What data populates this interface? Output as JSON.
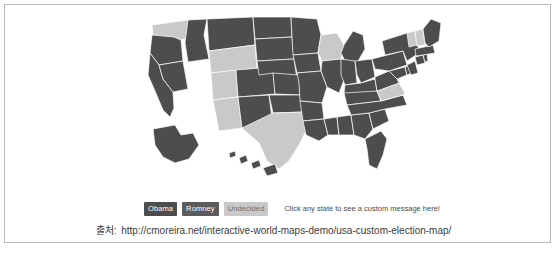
{
  "card": {
    "border_color": "#b9b9b9",
    "background": "#ffffff"
  },
  "legend": {
    "items": [
      {
        "label": "Obama",
        "color": "#4d4d4d",
        "text_color": "#ffffff"
      },
      {
        "label": "Romney",
        "color": "#5c5c5c",
        "text_color": "#ffffff"
      },
      {
        "label": "Undecided",
        "color": "#c9c9c9",
        "text_color": "#6e6e6e"
      }
    ],
    "hint": "Click any state to see a custom message here!"
  },
  "caption": {
    "source_label": "출처:",
    "url": "http://cmoreira.net/interactive-world-maps-demo/usa-custom-election-map/"
  },
  "map": {
    "title": "USA Custom Election Map",
    "colors": {
      "obama": "#4d4d4d",
      "romney": "#5c5c5c",
      "undecided": "#c9c9c9",
      "border": "#ffffff",
      "background": "#ffffff"
    },
    "legend_position": "below-map-left",
    "states": [
      {
        "code": "WA",
        "name": "Washington",
        "status": "Undecided"
      },
      {
        "code": "OR",
        "name": "Oregon",
        "status": "Obama"
      },
      {
        "code": "CA",
        "name": "California",
        "status": "Obama"
      },
      {
        "code": "NV",
        "name": "Nevada",
        "status": "Obama"
      },
      {
        "code": "ID",
        "name": "Idaho",
        "status": "Obama"
      },
      {
        "code": "MT",
        "name": "Montana",
        "status": "Obama"
      },
      {
        "code": "WY",
        "name": "Wyoming",
        "status": "Undecided"
      },
      {
        "code": "UT",
        "name": "Utah",
        "status": "Undecided"
      },
      {
        "code": "AZ",
        "name": "Arizona",
        "status": "Undecided"
      },
      {
        "code": "CO",
        "name": "Colorado",
        "status": "Obama"
      },
      {
        "code": "NM",
        "name": "New Mexico",
        "status": "Obama"
      },
      {
        "code": "ND",
        "name": "North Dakota",
        "status": "Obama"
      },
      {
        "code": "SD",
        "name": "South Dakota",
        "status": "Obama"
      },
      {
        "code": "NE",
        "name": "Nebraska",
        "status": "Obama"
      },
      {
        "code": "KS",
        "name": "Kansas",
        "status": "Obama"
      },
      {
        "code": "OK",
        "name": "Oklahoma",
        "status": "Obama"
      },
      {
        "code": "TX",
        "name": "Texas",
        "status": "Undecided"
      },
      {
        "code": "MN",
        "name": "Minnesota",
        "status": "Obama"
      },
      {
        "code": "IA",
        "name": "Iowa",
        "status": "Obama"
      },
      {
        "code": "MO",
        "name": "Missouri",
        "status": "Obama"
      },
      {
        "code": "AR",
        "name": "Arkansas",
        "status": "Obama"
      },
      {
        "code": "LA",
        "name": "Louisiana",
        "status": "Obama"
      },
      {
        "code": "WI",
        "name": "Wisconsin",
        "status": "Undecided"
      },
      {
        "code": "IL",
        "name": "Illinois",
        "status": "Obama"
      },
      {
        "code": "MI",
        "name": "Michigan",
        "status": "Obama"
      },
      {
        "code": "IN",
        "name": "Indiana",
        "status": "Obama"
      },
      {
        "code": "OH",
        "name": "Ohio",
        "status": "Obama"
      },
      {
        "code": "KY",
        "name": "Kentucky",
        "status": "Obama"
      },
      {
        "code": "TN",
        "name": "Tennessee",
        "status": "Obama"
      },
      {
        "code": "MS",
        "name": "Mississippi",
        "status": "Obama"
      },
      {
        "code": "AL",
        "name": "Alabama",
        "status": "Obama"
      },
      {
        "code": "GA",
        "name": "Georgia",
        "status": "Obama"
      },
      {
        "code": "FL",
        "name": "Florida",
        "status": "Obama"
      },
      {
        "code": "SC",
        "name": "South Carolina",
        "status": "Obama"
      },
      {
        "code": "NC",
        "name": "North Carolina",
        "status": "Obama"
      },
      {
        "code": "VA",
        "name": "Virginia",
        "status": "Undecided"
      },
      {
        "code": "WV",
        "name": "West Virginia",
        "status": "Obama"
      },
      {
        "code": "MD",
        "name": "Maryland",
        "status": "Obama"
      },
      {
        "code": "DE",
        "name": "Delaware",
        "status": "Obama"
      },
      {
        "code": "PA",
        "name": "Pennsylvania",
        "status": "Obama"
      },
      {
        "code": "NJ",
        "name": "New Jersey",
        "status": "Obama"
      },
      {
        "code": "NY",
        "name": "New York",
        "status": "Obama"
      },
      {
        "code": "CT",
        "name": "Connecticut",
        "status": "Obama"
      },
      {
        "code": "RI",
        "name": "Rhode Island",
        "status": "Obama"
      },
      {
        "code": "MA",
        "name": "Massachusetts",
        "status": "Obama"
      },
      {
        "code": "VT",
        "name": "Vermont",
        "status": "Undecided"
      },
      {
        "code": "NH",
        "name": "New Hampshire",
        "status": "Undecided"
      },
      {
        "code": "ME",
        "name": "Maine",
        "status": "Obama"
      },
      {
        "code": "AK",
        "name": "Alaska",
        "status": "Obama"
      },
      {
        "code": "HI",
        "name": "Hawaii",
        "status": "Obama"
      }
    ]
  }
}
